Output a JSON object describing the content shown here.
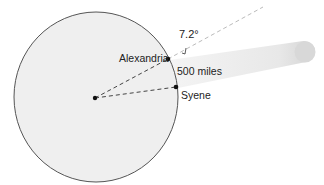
{
  "diagram": {
    "labels": {
      "alexandria": "Alexandria",
      "syene": "Syene",
      "distance": "500 miles",
      "angle": "7.2°"
    },
    "colors": {
      "earth_fill": "#efefef",
      "earth_stroke": "#555555",
      "dash": "#444444",
      "ray_dash": "#bbbbbb",
      "beam": "#e6e6e6",
      "dot": "#111111"
    }
  }
}
